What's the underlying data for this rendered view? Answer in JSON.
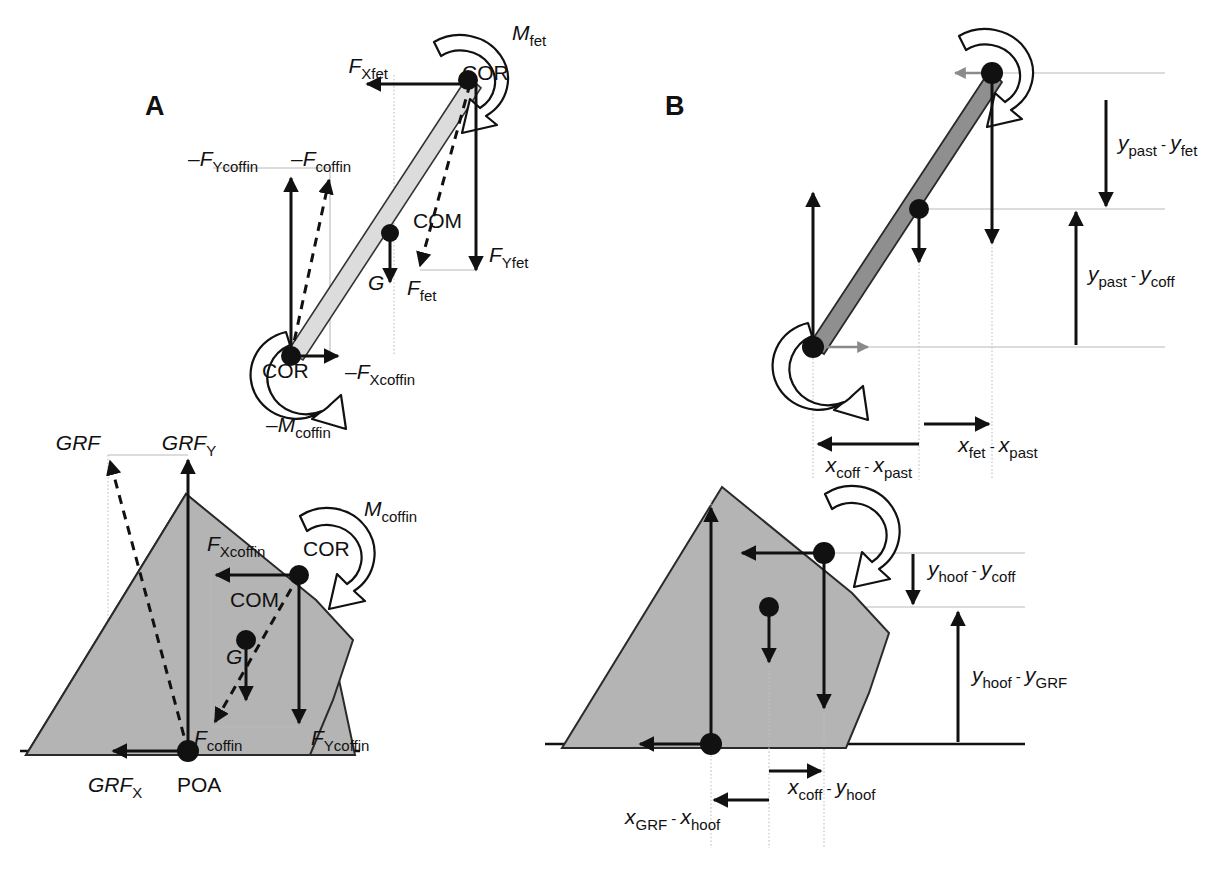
{
  "figure": {
    "width": 1212,
    "height": 870,
    "background": "#ffffff",
    "colors": {
      "ink": "#111111",
      "bone_light": "#dcdcdc",
      "bone_dark": "#8f8f8f",
      "hoof_fill": "#b4b4b4",
      "guide_gray": "#b9b9b9",
      "gray_vector": "#8a8a8a"
    }
  },
  "panels": [
    {
      "id": "A",
      "label": "A",
      "x": 145,
      "y": 115
    },
    {
      "id": "B",
      "label": "B",
      "x": 665,
      "y": 115
    }
  ],
  "panel_a": {
    "top_diagram": {
      "name": "pastern-free-body-diagram",
      "points": [
        {
          "name": "COR-proximal",
          "label": "COR",
          "label_x": 462,
          "label_y": 80
        },
        {
          "name": "COM",
          "label": "COM",
          "label_x": 413,
          "label_y": 228
        },
        {
          "name": "COR-distal",
          "label": "COR",
          "label_x": 262,
          "label_y": 378
        }
      ],
      "labels": [
        {
          "name": "moment-fetlock",
          "sym": "M",
          "sub": "fet",
          "sign": "",
          "x": 512,
          "y": 40
        },
        {
          "name": "force-x-fetlock",
          "sym": "F",
          "sub": "Xfet",
          "sign": "",
          "x": 388,
          "y": 73
        },
        {
          "name": "force-y-fetlock",
          "sym": "F",
          "sub": "Yfet",
          "sign": "",
          "x": 509,
          "y": 262
        },
        {
          "name": "force-fetlock",
          "sym": "F",
          "sub": "fet",
          "sign": "",
          "x": 427,
          "y": 288
        },
        {
          "name": "force-y-coffin-neg",
          "sym": "F",
          "sub": "Ycoffin",
          "sign": "–",
          "x": 188,
          "y": 172
        },
        {
          "name": "force-coffin-neg",
          "sym": "F",
          "sub": "coffin",
          "sign": "–",
          "x": 299,
          "y": 172
        },
        {
          "name": "force-x-coffin-neg",
          "sym": "F",
          "sub": "Xcoffin",
          "sign": "–",
          "x": 345,
          "y": 379
        },
        {
          "name": "moment-coffin-neg",
          "sym": "M",
          "sub": "coffin",
          "sign": "–",
          "x": 266,
          "y": 432
        },
        {
          "name": "gravity",
          "sym": "G",
          "sub": "",
          "sign": "",
          "x": 386,
          "y": 290
        }
      ]
    },
    "bottom_diagram": {
      "name": "hoof-free-body-diagram",
      "points": [
        {
          "name": "COR",
          "label": "COR",
          "label_x": 303,
          "label_y": 556
        },
        {
          "name": "COM",
          "label": "COM",
          "label_x": 230,
          "label_y": 607
        },
        {
          "name": "POA",
          "label": "POA",
          "label_x": 177,
          "label_y": 792
        }
      ],
      "labels": [
        {
          "name": "grf-resultant",
          "sym": "GRF",
          "sub": "",
          "sign": "",
          "x": 78,
          "y": 450
        },
        {
          "name": "grf-y",
          "sym": "GRF",
          "sub": "Y",
          "sign": "",
          "x": 186,
          "y": 450
        },
        {
          "name": "grf-x",
          "sym": "GRF",
          "sub": "X",
          "sign": "",
          "x": 88,
          "y": 792
        },
        {
          "name": "moment-coffin",
          "sym": "M",
          "sub": "coffin",
          "sign": "",
          "x": 364,
          "y": 516
        },
        {
          "name": "force-x-coffin",
          "sym": "F",
          "sub": "Xcoffin",
          "sign": "",
          "x": 207,
          "y": 551
        },
        {
          "name": "force-y-coffin",
          "sym": "F",
          "sub": "Ycoffin",
          "sign": "",
          "x": 311,
          "y": 745
        },
        {
          "name": "force-coffin",
          "sym": "F",
          "sub": "coffin",
          "sign": "",
          "x": 205,
          "y": 745
        },
        {
          "name": "gravity",
          "sym": "G",
          "sub": "",
          "sign": "",
          "x": 222,
          "y": 657
        }
      ]
    }
  },
  "panel_b": {
    "top_diagram": {
      "name": "pastern-moment-arm-diagram",
      "labels": [
        {
          "name": "moment-arm-y-past-fet",
          "minuend_sym": "y",
          "minuend_sub": "past",
          "op": "-",
          "subtrahend_sym": "y",
          "subtrahend_sub": "fet",
          "x": 1110,
          "y": 143
        },
        {
          "name": "moment-arm-y-past-coff",
          "minuend_sym": "y",
          "minuend_sub": "past",
          "op": "-",
          "subtrahend_sym": "y",
          "subtrahend_sub": "coff",
          "x": 1084,
          "y": 281
        },
        {
          "name": "moment-arm-x-coff-past",
          "minuend_sym": "x",
          "minuend_sub": "coff",
          "op": "-",
          "subtrahend_sym": "x",
          "subtrahend_sub": "past",
          "x": 855,
          "y": 466
        },
        {
          "name": "moment-arm-x-fet-past",
          "minuend_sym": "x",
          "minuend_sub": "fet",
          "op": "-",
          "subtrahend_sym": "x",
          "subtrahend_sub": "past",
          "x": 1007,
          "y": 450
        }
      ]
    },
    "bottom_diagram": {
      "name": "hoof-moment-arm-diagram",
      "labels": [
        {
          "name": "moment-arm-y-hoof-coff",
          "minuend_sym": "y",
          "minuend_sub": "hoof",
          "op": "-",
          "subtrahend_sym": "y",
          "subtrahend_sub": "coff",
          "x": 1008,
          "y": 576
        },
        {
          "name": "moment-arm-y-hoof-grf",
          "minuend_sym": "y",
          "minuend_sub": "hoof",
          "op": "-",
          "subtrahend_sym": "y",
          "subtrahend_sub": "GRF",
          "x": 1010,
          "y": 674
        },
        {
          "name": "moment-arm-x-coff-hoof",
          "minuend_sym": "x",
          "minuend_sub": "coff",
          "op": "-",
          "subtrahend_sym": "y",
          "subtrahend_sub": "hoof",
          "x": 788,
          "y": 788
        },
        {
          "name": "moment-arm-x-grf-hoof",
          "minuend_sym": "x",
          "minuend_sub": "GRF",
          "op": "-",
          "subtrahend_sym": "x",
          "subtrahend_sub": "hoof",
          "x": 692,
          "y": 818
        }
      ]
    }
  }
}
